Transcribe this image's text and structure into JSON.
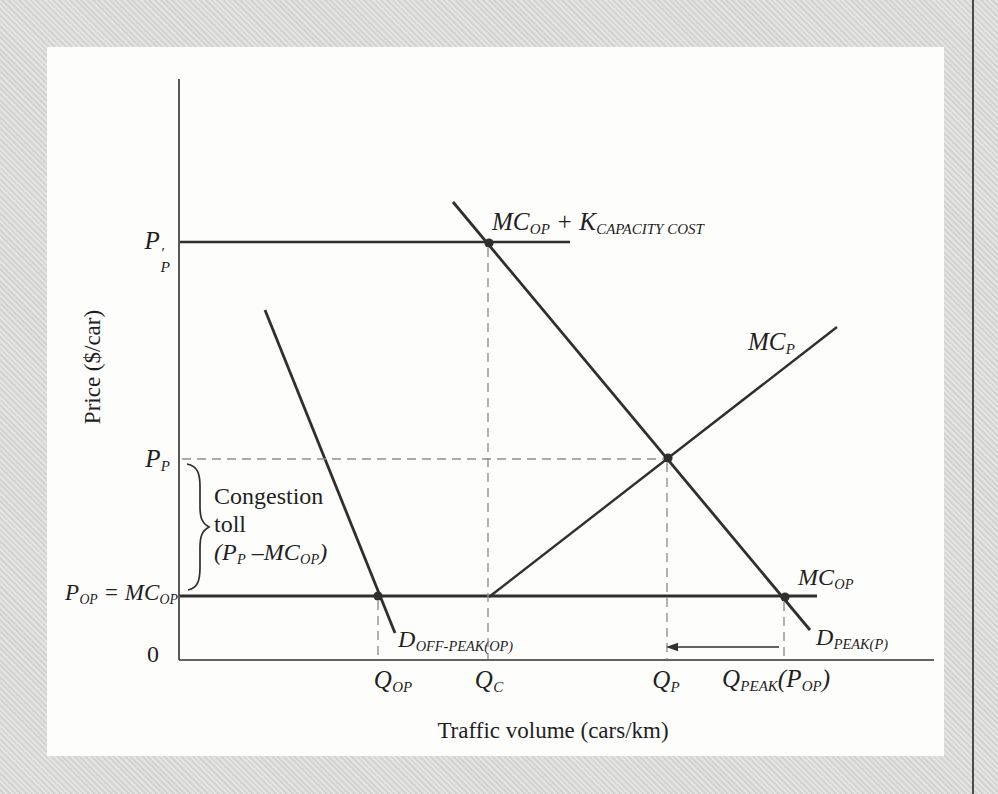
{
  "figure": {
    "background_color": "#dadad8",
    "panel_color": "#fdfdfc",
    "line_color": "#2f2f2f",
    "dash_color": "#909090",
    "text_color": "#1f1f1f"
  },
  "axes": {
    "y_label": "Price ($/car)",
    "x_label": "Traffic volume (cars/km)",
    "origin_label": "0"
  },
  "labels": {
    "pp_prime": {
      "base": "P",
      "prime": "′",
      "sub": "P"
    },
    "mc_k": {
      "m1": "MC",
      "s1": "OP",
      "m2": " + K",
      "s2": "CAPACITY COST"
    },
    "mc_p": {
      "m1": "MC",
      "s1": "P"
    },
    "p_p": {
      "m1": "P",
      "s1": "P"
    },
    "congestion": {
      "line1": "Congestion",
      "line2": "toll",
      "f1": "(P",
      "fs1": "P",
      "f2": " –MC",
      "fs2": "OP",
      "f3": ")"
    },
    "p_op": {
      "m1": "P",
      "s1": "OP",
      "m2": " = MC",
      "s2": "OP"
    },
    "mc_op_right": {
      "m1": "MC",
      "s1": "OP"
    },
    "d_offpeak": {
      "m1": "D",
      "s1": "OFF-PEAK(OP)"
    },
    "d_peak": {
      "m1": "D",
      "s1": "PEAK(P)"
    },
    "q_op": {
      "m1": "Q",
      "s1": "OP"
    },
    "q_c": {
      "m1": "Q",
      "s1": "C"
    },
    "q_p": {
      "m1": "Q",
      "s1": "P"
    },
    "q_peak": {
      "m1": "Q",
      "s1": "PEAK",
      "m2": "(P",
      "s2": "OP",
      "m3": ")"
    }
  },
  "geometry": {
    "lines": [
      {
        "name": "y-axis",
        "x1": 179,
        "y1": 79,
        "x2": 179,
        "y2": 660,
        "w": 1.6
      },
      {
        "name": "x-axis",
        "x1": 179,
        "y1": 660,
        "x2": 934,
        "y2": 660,
        "w": 1.6
      },
      {
        "name": "mc-op-plus-k-line",
        "x1": 180,
        "y1": 242,
        "x2": 570,
        "y2": 242,
        "w": 2.6
      },
      {
        "name": "mc-op-line",
        "x1": 180,
        "y1": 596,
        "x2": 817,
        "y2": 596,
        "w": 3
      },
      {
        "name": "d-peak-curve",
        "x1": 453,
        "y1": 202,
        "x2": 810,
        "y2": 630,
        "w": 2.8
      },
      {
        "name": "d-off-peak-curve",
        "x1": 265,
        "y1": 310,
        "x2": 395,
        "y2": 633,
        "w": 2.8
      },
      {
        "name": "mc-p-curve",
        "x1": 489,
        "y1": 597,
        "x2": 837,
        "y2": 327,
        "w": 2.4
      },
      {
        "name": "qc-dashed-line",
        "x1": 488,
        "y1": 248,
        "x2": 488,
        "y2": 659,
        "dashed": true
      },
      {
        "name": "qop-dashed-line",
        "x1": 378,
        "y1": 601,
        "x2": 378,
        "y2": 659,
        "dashed": true
      },
      {
        "name": "qp-dashed-line",
        "x1": 667,
        "y1": 463,
        "x2": 667,
        "y2": 659,
        "dashed": true
      },
      {
        "name": "qpeak-dashed-line",
        "x1": 784,
        "y1": 602,
        "x2": 784,
        "y2": 659,
        "dashed": true
      },
      {
        "name": "pp-dashed-line",
        "x1": 182,
        "y1": 459,
        "x2": 663,
        "y2": 459,
        "dashed": true
      }
    ],
    "dots": [
      {
        "name": "intersection-dot-qc",
        "x": 489,
        "y": 243
      },
      {
        "name": "intersection-dot-qp",
        "x": 668,
        "y": 458
      },
      {
        "name": "intersection-dot-qop",
        "x": 378,
        "y": 596
      },
      {
        "name": "intersection-dot-qpeak",
        "x": 785,
        "y": 597
      }
    ],
    "dot_radius": 4.6,
    "brace_path": "M 187 464 C 198 466 200 474 200 487 L 200 506 C 200 518 202 523 209 527 C 202 531 200 536 200 548 L 200 567 C 200 580 198 588 188 590",
    "arrow": {
      "line": {
        "x1": 779,
        "y1": 647,
        "x2": 676,
        "y2": 647,
        "w": 1.5
      },
      "head_points": "666,647 678,642.7 678,651.3"
    },
    "page_edge_x": 972
  }
}
